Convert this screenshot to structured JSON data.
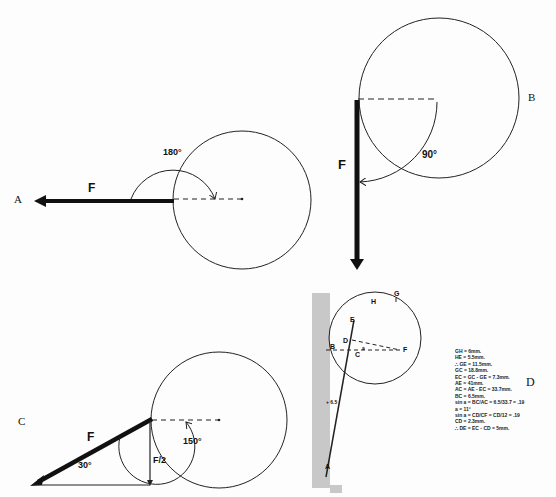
{
  "figure": {
    "panels": [
      {
        "id": "A",
        "label": "A",
        "force_label": "F",
        "angle_label": "180°",
        "description": "Force F applied horizontally to the left, 180° from the radius line"
      },
      {
        "id": "B",
        "label": "B",
        "force_label": "F",
        "angle_label": "90°",
        "description": "Force F applied vertically downward, 90° from the radius line"
      },
      {
        "id": "C",
        "label": "C",
        "force_label": "F",
        "component_label": "F/2",
        "angle_label": "150°",
        "triangle_angle_label": "30°",
        "description": "Force F at 30° below horizontal, vertical component F/2, 150° from the radius line"
      },
      {
        "id": "D",
        "label": "D",
        "points": [
          "A",
          "B",
          "C",
          "D",
          "E",
          "F",
          "G",
          "H"
        ],
        "angle_symbol": "a",
        "side_marker": "+ 6.5",
        "calculations": [
          "GH = 6mm.",
          "HE = 5.5mm.",
          "∴ GE = 11.5mm.",
          "GC = 18.8mm.",
          "EC = GC - GE = 7.3mm.",
          "AE = 41mm.",
          "AC = AE - EC = 33.7mm.",
          "BC = 6.5mm.",
          "sin a = BC/AC = 6.5/33.7 = .19",
          "a = 11°",
          "sin a = CD/CF = CD/12 = .19",
          "CD = 2.3mm.",
          "∴ DE = EC - CD = 5mm."
        ]
      }
    ]
  }
}
